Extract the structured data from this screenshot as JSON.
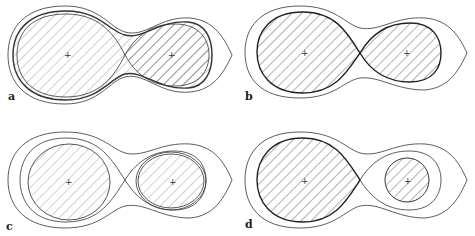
{
  "figure": {
    "panels": [
      {
        "id": "a",
        "label": "a",
        "description": "Both lobes overfilling, overcontact envelope with two inner contours"
      },
      {
        "id": "b",
        "label": "b",
        "description": "Both stars filling Roche lobes (contact)"
      },
      {
        "id": "c",
        "label": "c",
        "description": "Both stars detached within lobes"
      },
      {
        "id": "d",
        "label": "d",
        "description": "Primary fills lobe, secondary detached (semi-detached)"
      }
    ],
    "colors": {
      "stroke": "#333333",
      "hatch": "#555555",
      "background": "#ffffff"
    }
  }
}
